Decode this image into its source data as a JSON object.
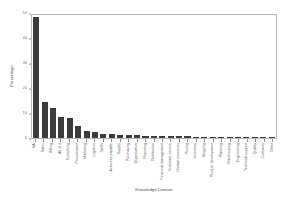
{
  "chart_data": {
    "type": "bar",
    "title": "",
    "xlabel": "Knowledge Domain",
    "ylabel": "Percentage",
    "ylim": [
      0,
      50
    ],
    "yticks": [
      0,
      10,
      20,
      30,
      40,
      50
    ],
    "grid": false,
    "legend": "none",
    "bar_color": "#3b3b3b",
    "categories": [
      "NA",
      "Sales",
      "Billing",
      "All of it",
      "Everything",
      "Procurement",
      "Marketing",
      "Logistics",
      "Tariffs",
      "Accounts payable",
      "Supply",
      "Purchasing",
      "Organisation",
      "Reporting",
      "Distribution",
      "Financial management",
      "Customer service",
      "Human resources",
      "Pricing",
      "Inventory",
      "Shipping",
      "Product development",
      "Planning",
      "Warehousing",
      "Engineering",
      "Technical support",
      "Quality",
      "Contracts",
      "Other"
    ],
    "values": [
      49.0,
      14.5,
      12.0,
      8.5,
      8.0,
      5.0,
      3.0,
      2.5,
      1.8,
      1.6,
      1.4,
      1.2,
      1.1,
      1.0,
      0.9,
      0.8,
      0.8,
      0.7,
      0.7,
      0.6,
      0.6,
      0.5,
      0.5,
      0.5,
      0.4,
      0.4,
      0.4,
      0.3,
      0.3
    ]
  }
}
